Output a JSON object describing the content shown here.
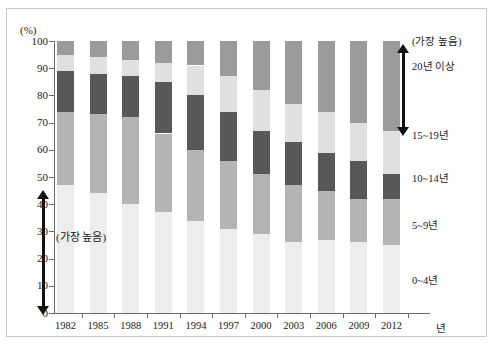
{
  "chart_data": {
    "type": "bar",
    "subtype": "stacked-percentage",
    "title": "",
    "subtitle": "",
    "xlabel": "년",
    "ylabel": "(%)",
    "ylim": [
      0,
      100
    ],
    "y_ticks": [
      0,
      10,
      20,
      30,
      40,
      50,
      60,
      70,
      80,
      90,
      100
    ],
    "grid": false,
    "legend_position": "right",
    "categories": [
      "1982",
      "1985",
      "1988",
      "1991",
      "1994",
      "1997",
      "2000",
      "2003",
      "2006",
      "2009",
      "2012"
    ],
    "series": [
      {
        "name": "0~4년",
        "color": "#ededed",
        "values": [
          47,
          44,
          40,
          37,
          34,
          31,
          29,
          26,
          27,
          26,
          25
        ]
      },
      {
        "name": "5~9년",
        "color": "#b4b4b4",
        "values": [
          27,
          29,
          32,
          29,
          26,
          25,
          22,
          21,
          18,
          16,
          17
        ]
      },
      {
        "name": "10~14년",
        "color": "#585858",
        "values": [
          15,
          15,
          15,
          19,
          20,
          18,
          16,
          16,
          14,
          14,
          9
        ]
      },
      {
        "name": "15~19년",
        "color": "#e0e0e0",
        "values": [
          6,
          6,
          6,
          7,
          11,
          13,
          15,
          14,
          15,
          14,
          16
        ]
      },
      {
        "name": "20년 이상",
        "color": "#9b9b9b",
        "values": [
          5,
          6,
          7,
          8,
          9,
          13,
          18,
          23,
          26,
          30,
          33
        ]
      }
    ]
  },
  "axes": {
    "unit_label": "(%)",
    "x_title": "년",
    "y_tick_labels": [
      "100",
      "90",
      "80",
      "70",
      "60",
      "50",
      "40",
      "30",
      "20",
      "10",
      "0"
    ],
    "x_tick_labels": [
      "1982",
      "1985",
      "1988",
      "1991",
      "1994",
      "1997",
      "2000",
      "2003",
      "2006",
      "2009",
      "2012"
    ]
  },
  "legend": {
    "top_note": "(가장 높음)",
    "items": [
      {
        "label": "20년 이상"
      },
      {
        "label": "15~19년"
      },
      {
        "label": "10~14년"
      },
      {
        "label": "5~9년"
      },
      {
        "label": "0~4년"
      }
    ]
  },
  "annotations": {
    "left_note": "(가장 높음)"
  }
}
